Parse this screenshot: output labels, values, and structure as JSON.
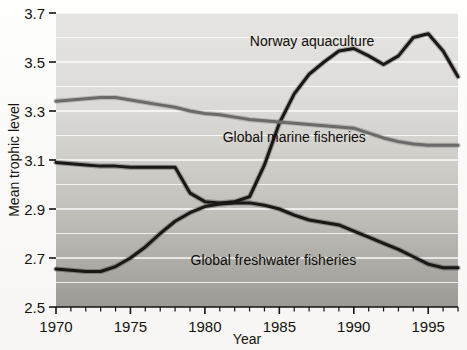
{
  "chart_data": {
    "type": "line",
    "title": "",
    "xlabel": "Year",
    "ylabel": "Mean trophic level",
    "xlim": [
      1970,
      1997
    ],
    "ylim": [
      2.5,
      3.7
    ],
    "xticks": [
      1970,
      1975,
      1980,
      1985,
      1990,
      1995
    ],
    "xtick_labels": [
      "1970",
      "1975",
      "1980",
      "1985",
      "1990",
      "1995"
    ],
    "yticks": [
      2.5,
      2.7,
      2.9,
      3.1,
      3.3,
      3.5,
      3.7
    ],
    "ytick_labels": [
      "2.5",
      "2.7",
      "2.9",
      "3.1",
      "3.3",
      "3.5",
      "3.7"
    ],
    "minor_yticks": [
      2.6,
      2.8,
      3.0,
      3.2,
      3.4,
      3.6
    ],
    "grid": true,
    "grid_axis": "y",
    "legend": "inline-labels",
    "x": [
      1970,
      1971,
      1972,
      1973,
      1974,
      1975,
      1976,
      1977,
      1978,
      1979,
      1980,
      1981,
      1982,
      1983,
      1984,
      1985,
      1986,
      1987,
      1988,
      1989,
      1990,
      1991,
      1992,
      1993,
      1994,
      1995,
      1996,
      1997
    ],
    "series": [
      {
        "name": "Norway aquaculture",
        "color": "#1a1714",
        "label": "Norway aquaculture",
        "label_x": 1987.2,
        "label_y": 3.565,
        "values": [
          3.09,
          3.085,
          3.08,
          3.075,
          3.075,
          3.07,
          3.07,
          3.07,
          3.07,
          2.965,
          2.93,
          2.925,
          2.93,
          2.95,
          3.08,
          3.25,
          3.37,
          3.45,
          3.5,
          3.545,
          3.555,
          3.525,
          3.49,
          3.525,
          3.6,
          3.615,
          3.545,
          3.44
        ]
      },
      {
        "name": "Global marine fisheries",
        "color": "#6a6a68",
        "label": "Global marine fisheries",
        "label_x": 1986.0,
        "label_y": 3.175,
        "values": [
          3.34,
          3.345,
          3.35,
          3.355,
          3.355,
          3.345,
          3.335,
          3.325,
          3.315,
          3.3,
          3.29,
          3.285,
          3.275,
          3.265,
          3.26,
          3.255,
          3.25,
          3.245,
          3.24,
          3.235,
          3.23,
          3.21,
          3.19,
          3.175,
          3.165,
          3.16,
          3.16,
          3.16
        ]
      },
      {
        "name": "Global freshwater fisheries",
        "color": "#1a1714",
        "label": "Global freshwater fisheries",
        "label_x": 1984.6,
        "label_y": 2.67,
        "values": [
          2.655,
          2.65,
          2.645,
          2.645,
          2.665,
          2.7,
          2.745,
          2.8,
          2.85,
          2.885,
          2.91,
          2.92,
          2.925,
          2.925,
          2.915,
          2.9,
          2.875,
          2.855,
          2.845,
          2.835,
          2.81,
          2.785,
          2.76,
          2.735,
          2.705,
          2.675,
          2.66,
          2.66
        ]
      }
    ],
    "colors": {
      "axis": "#15120f",
      "gridline": "#ffffff",
      "plot_bg_top": "#e3e2de",
      "plot_bg_bottom": "#9e9d99",
      "page_bg": "#fdfdfc"
    }
  },
  "axis": {
    "ylabel": "Mean trophic level",
    "xlabel": "Year"
  }
}
